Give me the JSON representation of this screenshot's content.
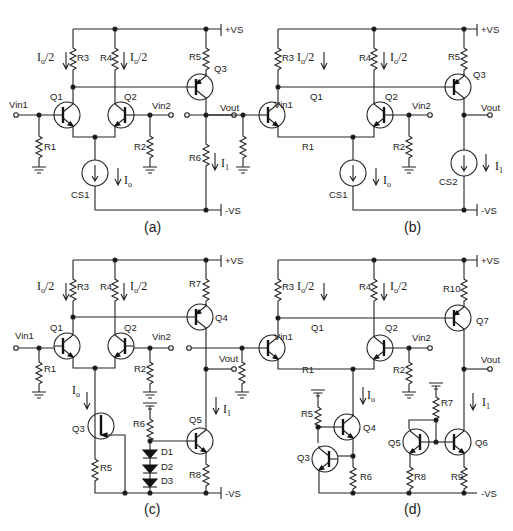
{
  "figure": {
    "panels": [
      {
        "id": "a",
        "caption": "(a)",
        "rails": {
          "pos": "+VS",
          "neg": "-VS"
        },
        "inputs": [
          "Vin1",
          "Vin2"
        ],
        "output": "Vout",
        "transistors": [
          "Q1",
          "Q2",
          "Q3"
        ],
        "resistors": [
          "R1",
          "R2",
          "R3",
          "R4",
          "R5",
          "R6"
        ],
        "sources": [
          "CS1"
        ],
        "currents": {
          "half": "Io/2",
          "tail": "Io",
          "out": "I1"
        }
      },
      {
        "id": "b",
        "caption": "(b)",
        "rails": {
          "pos": "+VS",
          "neg": "-VS"
        },
        "inputs": [
          "Vin1",
          "Vin2"
        ],
        "output": "Vout",
        "transistors": [
          "Q1",
          "Q2",
          "Q3"
        ],
        "resistors": [
          "R1",
          "R2",
          "R3",
          "R4",
          "R5"
        ],
        "sources": [
          "CS1",
          "CS2"
        ],
        "currents": {
          "half": "Io/2",
          "tail": "Io",
          "out": "I1"
        }
      },
      {
        "id": "c",
        "caption": "(c)",
        "rails": {
          "pos": "+VS",
          "neg": "-VS"
        },
        "inputs": [
          "Vin1",
          "Vin2"
        ],
        "output": "Vout",
        "transistors": [
          "Q1",
          "Q2",
          "Q3",
          "Q4",
          "Q5"
        ],
        "resistors": [
          "R1",
          "R2",
          "R3",
          "R4",
          "R5",
          "R6",
          "R7",
          "R8"
        ],
        "diodes": [
          "D1",
          "D2",
          "D3"
        ],
        "currents": {
          "half": "Io/2",
          "tail": "Io",
          "out": "I1"
        }
      },
      {
        "id": "d",
        "caption": "(d)",
        "rails": {
          "pos": "+VS",
          "neg": "-VS"
        },
        "inputs": [
          "Vin1",
          "Vin2"
        ],
        "output": "Vout",
        "transistors": [
          "Q1",
          "Q2",
          "Q3",
          "Q4",
          "Q5",
          "Q6",
          "Q7"
        ],
        "resistors": [
          "R1",
          "R2",
          "R3",
          "R4",
          "R5",
          "R6",
          "R7",
          "R8",
          "R9",
          "R10"
        ],
        "currents": {
          "half": "Io/2",
          "tail": "Io",
          "out": "I1"
        }
      }
    ]
  },
  "labels": {
    "pos": "+VS",
    "neg": "-VS",
    "vin1": "Vin1",
    "vin2": "Vin2",
    "vout": "Vout",
    "I": "I",
    "o": "o",
    "slash2": "/2",
    "one": "1",
    "Q1": "Q1",
    "Q2": "Q2",
    "Q3": "Q3",
    "Q4": "Q4",
    "Q5": "Q5",
    "Q6": "Q6",
    "Q7": "Q7",
    "R1": "R1",
    "R2": "R2",
    "R3": "R3",
    "R4": "R4",
    "R5": "R5",
    "R6": "R6",
    "R7": "R7",
    "R8": "R8",
    "R9": "R9",
    "R10": "R10",
    "CS1": "CS1",
    "CS2": "CS2",
    "D1": "D1",
    "D2": "D2",
    "D3": "D3",
    "capA": "(a)",
    "capB": "(b)",
    "capC": "(c)",
    "capD": "(d)"
  }
}
